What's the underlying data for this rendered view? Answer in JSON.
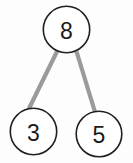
{
  "diagram": {
    "type": "number-bond",
    "background_color": "#fdfdfd",
    "node_stroke_color": "#231f20",
    "node_fill_color": "#ffffff",
    "connector_color": "#9a9a9a",
    "label_color": "#1b1b1b",
    "whole": {
      "label": "8",
      "value": 8,
      "cx": 66.5,
      "cy": 29.5,
      "r": 23.2
    },
    "parts": [
      {
        "label": "3",
        "value": 3,
        "cx": 33.5,
        "cy": 131.5,
        "r": 23.2
      },
      {
        "label": "5",
        "value": 5,
        "cx": 99.0,
        "cy": 134.0,
        "r": 22.8
      }
    ],
    "connectors": [
      {
        "from": "whole",
        "to": "part-3",
        "x1": 57.0,
        "y1": 51.5,
        "x2": 28.5,
        "y2": 109.5
      },
      {
        "from": "whole",
        "to": "part-5",
        "x1": 76.5,
        "y1": 51.5,
        "x2": 95.0,
        "y2": 112.0
      }
    ]
  }
}
